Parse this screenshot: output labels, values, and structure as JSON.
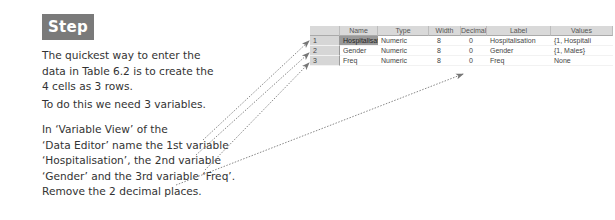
{
  "step": {
    "title": "Step 1:"
  },
  "instructions": {
    "p1": "The quickest way to enter the data in Table 6.2 is to create the 4 cells as 3 rows.",
    "p2": "To do this we need 3 variables.",
    "p3_lines": [
      "In ‘Variable View’ of the",
      "‘Data Editor’ name the 1st variable",
      "‘Hospitalisation’, the 2nd variable",
      "‘Gender’ and the 3rd variable ‘Freq’.",
      "Remove the 2 decimal places."
    ]
  },
  "variable_view": {
    "columns": [
      "",
      "Name",
      "Type",
      "Width",
      "Decimals",
      "Label",
      "Values"
    ],
    "rows": [
      {
        "num": "1",
        "name": "Hospitalisati",
        "type": "Numeric",
        "width": "8",
        "decimals": "0",
        "label": "Hospitalisation",
        "values": "{1, Hospitali"
      },
      {
        "num": "2",
        "name": "Gender",
        "type": "Numeric",
        "width": "8",
        "decimals": "0",
        "label": "Gender",
        "values": "{1, Males}"
      },
      {
        "num": "3",
        "name": "Freq",
        "type": "Numeric",
        "width": "8",
        "decimals": "0",
        "label": "Freq",
        "values": "None"
      }
    ]
  },
  "colors": {
    "step_header_bg": "#7a7a7a",
    "arrow": "#888888"
  }
}
